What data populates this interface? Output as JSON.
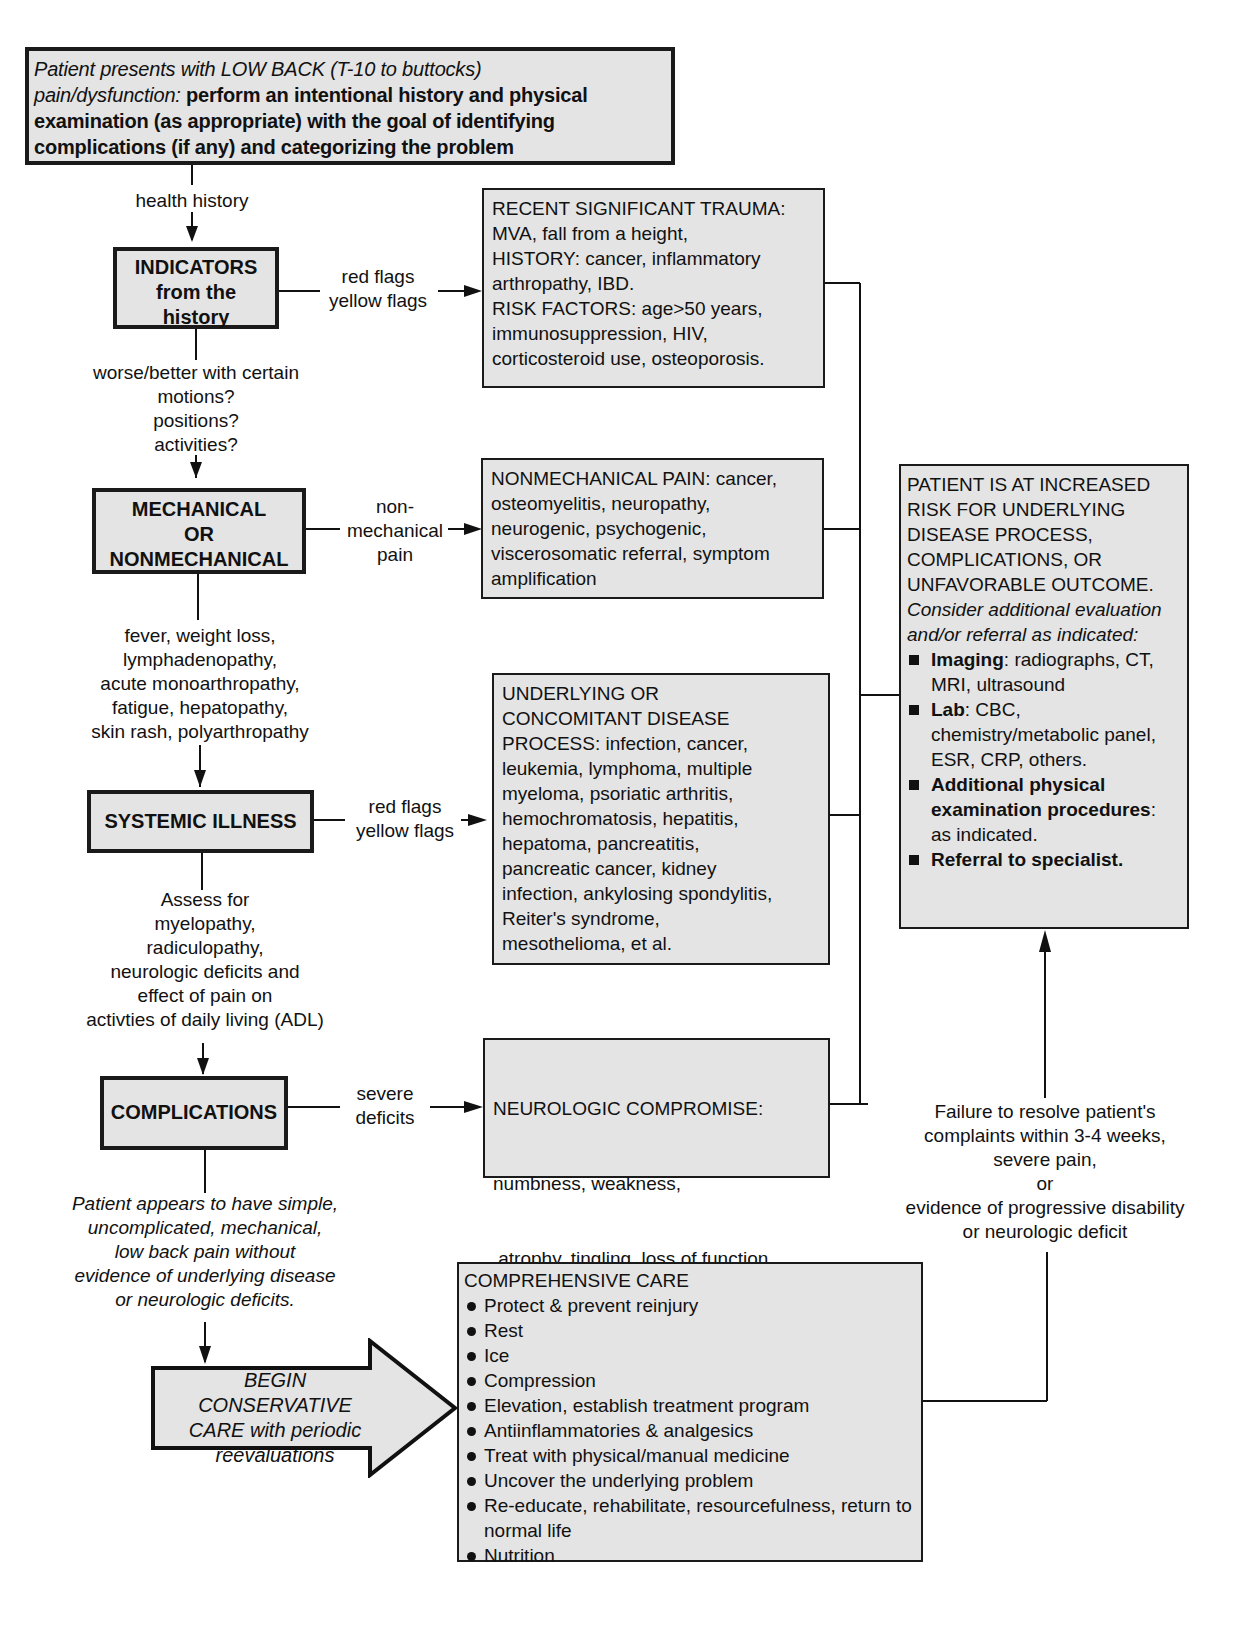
{
  "top_box": {
    "italic_1": "Patient presents with LOW BACK (T-10 to buttocks)",
    "italic_2": "pain/dysfunction:",
    "bold": " perform an intentional history and physical examination (as appropriate) with the goal of identifying complications (if any) and categorizing the problem"
  },
  "left_column": {
    "label_health_history": "health history",
    "indicators": {
      "title_lines": [
        "INDICATORS",
        "from the",
        "history"
      ]
    },
    "label_motions": [
      "worse/better with certain",
      "motions?",
      "positions?",
      "activities?"
    ],
    "mechanical": {
      "title_lines": [
        "MECHANICAL",
        "OR",
        "NONMECHANICAL"
      ]
    },
    "label_symptoms": [
      "fever, weight loss,",
      "lymphadenopathy,",
      "acute monoarthropathy,",
      "fatigue, hepatopathy,",
      "skin rash, polyarthropathy"
    ],
    "systemic": {
      "title": "SYSTEMIC ILLNESS"
    },
    "label_assess": [
      "Assess for",
      "myelopathy,",
      "radiculopathy,",
      "neurologic deficits and",
      "effect of pain on",
      "activties of daily living (ADL)"
    ],
    "complications": {
      "title": "COMPLICATIONS"
    },
    "label_simple": [
      "Patient appears to have simple,",
      "uncomplicated, mechanical,",
      "low back pain without",
      "evidence of underlying disease",
      "or neurologic deficits."
    ],
    "conservative_arrow": {
      "lines": [
        "BEGIN",
        "CONSERVATIVE",
        "CARE with periodic",
        "reevaluations"
      ]
    }
  },
  "edge_labels": {
    "indicators_to_trauma": [
      "red flags",
      "yellow flags"
    ],
    "mechanical_to_nonmech": [
      "non-",
      "mechanical",
      "pain"
    ],
    "systemic_to_underlying": [
      "red flags",
      "yellow flags"
    ],
    "complications_to_neuro": [
      "severe",
      "deficits"
    ]
  },
  "middle_column": {
    "trauma_box": [
      "RECENT SIGNIFICANT  TRAUMA:",
      "MVA, fall from a height,",
      "HISTORY: cancer, inflammatory",
      "arthropathy, IBD.",
      "RISK FACTORS: age>50 years,",
      "immunosuppression, HIV,",
      "corticosteroid use, osteoporosis."
    ],
    "nonmech_box": [
      "NONMECHANICAL PAIN: cancer,",
      "osteomyelitis, neuropathy,",
      "neurogenic, psychogenic,",
      "viscerosomatic referral, symptom",
      "amplification"
    ],
    "underlying_box": [
      "UNDERLYING OR",
      "CONCOMITANT DISEASE",
      "PROCESS: infection, cancer,",
      "leukemia, lymphoma, multiple",
      "myeloma, psoriatic arthritis,",
      "hemochromatosis, hepatitis,",
      "hepatoma, pancreatitis,",
      "pancreatic cancer, kidney",
      "infection, ankylosing spondylitis,",
      "Reiter's syndrome,",
      "mesothelioma, et al."
    ],
    "neuro_box": [
      "NEUROLOGIC COMPROMISE:",
      "numbness, weakness,",
      " atrophy, tingling, loss of function,",
      "impaired bowel/ bladder function,",
      "genital dysfunction"
    ],
    "care_box": {
      "title": "COMPREHENSIVE CARE",
      "items": [
        "Protect & prevent reinjury",
        "Rest",
        "Ice",
        "Compression",
        "Elevation, establish treatment program",
        "Antiinflammatories & analgesics",
        "Treat with physical/manual medicine",
        "Uncover the underlying problem",
        "Re-educate, rehabilitate, resourcefulness, return to normal life",
        "Nutrition"
      ]
    }
  },
  "right_column": {
    "risk_box": {
      "caps_lines": [
        "PATIENT IS AT INCREASED",
        "RISK FOR UNDERLYING",
        "DISEASE PROCESS,",
        "COMPLICATIONS, OR",
        "UNFAVORABLE OUTCOME."
      ],
      "italic": "Consider additional evaluation and/or referral as indicated:",
      "items": [
        {
          "bold": "Imaging",
          "rest": ": radiographs, CT, MRI, ultrasound"
        },
        {
          "bold": "Lab",
          "rest": ": CBC, chemistry/metabolic panel, ESR, CRP, others."
        },
        {
          "bold": "Additional physical examination procedures",
          "rest": ": as indicated."
        },
        {
          "bold": "Referral to specialist.",
          "rest": ""
        }
      ]
    },
    "failure_label": [
      "Failure to resolve patient's",
      "complaints within 3-4 weeks,",
      "severe pain,",
      "or",
      "evidence of progressive disability",
      "or neurologic deficit"
    ]
  }
}
